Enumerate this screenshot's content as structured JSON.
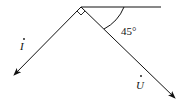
{
  "diagram": {
    "type": "phasor-diagram",
    "origin": [
      81,
      7
    ],
    "reference_line": {
      "from": [
        81,
        7
      ],
      "to": [
        161,
        7
      ]
    },
    "vectors": [
      {
        "name": "current",
        "label": "I",
        "dot": true,
        "from": [
          81,
          7
        ],
        "to": [
          14,
          75
        ]
      },
      {
        "name": "voltage",
        "label": "U",
        "dot": true,
        "from": [
          81,
          7
        ],
        "to": [
          175,
          98
        ]
      }
    ],
    "right_angle_marker": true,
    "angle": {
      "value": "45°",
      "between": [
        "reference_line",
        "voltage"
      ]
    },
    "color": "#111111"
  }
}
